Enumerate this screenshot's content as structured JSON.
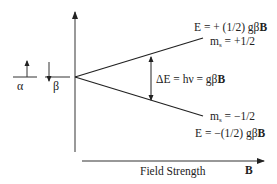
{
  "diagram": {
    "type": "energy-level-splitting (Zeeman)",
    "spin_states": {
      "alpha": {
        "label": "α",
        "arrow": "up"
      },
      "beta": {
        "label": "β",
        "arrow": "down"
      }
    },
    "upper_level": {
      "energy_label": "E  = + (1/2) gβ",
      "energy_bold": "B",
      "ms_label": "m",
      "ms_sub": "s",
      "ms_value": " = +1/2"
    },
    "lower_level": {
      "energy_label": "E  = −(1/2) gβ",
      "energy_bold": "B",
      "ms_label": "m",
      "ms_sub": "s",
      "ms_value": " = −1/2"
    },
    "gap": {
      "label": "ΔE = hν = gβ",
      "bold": "B"
    },
    "x_axis": {
      "label": "Field Strength",
      "symbol": "B"
    },
    "colors": {
      "line": "#222222",
      "axis": "#555555",
      "background": "#ffffff"
    }
  }
}
